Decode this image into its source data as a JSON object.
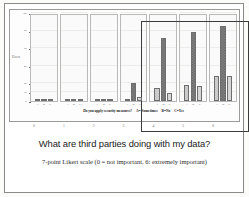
{
  "slide": {
    "title": "What  are third parties doing with my data?",
    "subtitle": "7-point Likert scale (0 = not important, 6: extremely important)"
  },
  "chart_data": {
    "type": "bar",
    "title": "Do you apply security measures?",
    "xlabel": "",
    "ylabel": "Users",
    "ylim": [
      0,
      100
    ],
    "yticks": [
      0,
      10,
      20,
      40,
      60,
      80,
      100
    ],
    "grid": true,
    "legend_position": "below",
    "legend": [
      {
        "key": "A",
        "label": "A= Sometimes"
      },
      {
        "key": "B",
        "label": "B=No"
      },
      {
        "key": "C",
        "label": "C=Yes"
      }
    ],
    "categories": [
      "A",
      "B",
      "C"
    ],
    "panels": [
      {
        "likert": "0",
        "values": [
          1,
          1,
          1
        ]
      },
      {
        "likert": "1",
        "values": [
          1,
          1,
          1
        ]
      },
      {
        "likert": "2",
        "values": [
          2,
          1,
          2
        ]
      },
      {
        "likert": "3",
        "values": [
          2,
          20,
          5
        ]
      },
      {
        "likert": "4",
        "values": [
          15,
          72,
          9
        ]
      },
      {
        "likert": "5",
        "values": [
          18,
          78,
          17
        ]
      },
      {
        "likert": "6",
        "values": [
          28,
          85,
          28
        ]
      }
    ],
    "highlight_panels": [
      "3",
      "4",
      "5",
      "6"
    ]
  },
  "likert_numbers": [
    "0",
    "1",
    "2",
    "3",
    "4",
    "5",
    "6"
  ],
  "colors": {
    "bar_a": "#b7b7b7",
    "bar_b": "#5e5e5e",
    "bar_c": "#c6c6c6",
    "highlight_border": "#3c3c3c",
    "frame": "#9a9a98"
  }
}
